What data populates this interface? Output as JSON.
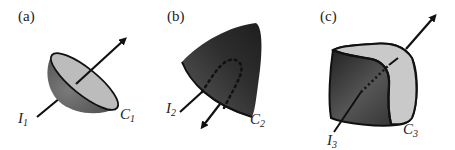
{
  "panels": [
    {
      "id": "a",
      "label": "(a)",
      "shape": "hemispherical bowl",
      "current_label": "I",
      "current_sub": "1",
      "curve_label": "C",
      "curve_sub": "1"
    },
    {
      "id": "b",
      "label": "(b)",
      "shape": "pointed cap",
      "current_label": "I",
      "current_sub": "2",
      "curve_label": "C",
      "curve_sub": "2"
    },
    {
      "id": "c",
      "label": "(c)",
      "shape": "closed box-like surface",
      "current_label": "I",
      "current_sub": "3",
      "curve_label": "C",
      "curve_sub": "3"
    }
  ],
  "colors": {
    "dark_surface": "#3c3c3c",
    "mid_surface": "#6a6a6a",
    "light_surface": "#c8c8c8",
    "line": "#111111"
  }
}
